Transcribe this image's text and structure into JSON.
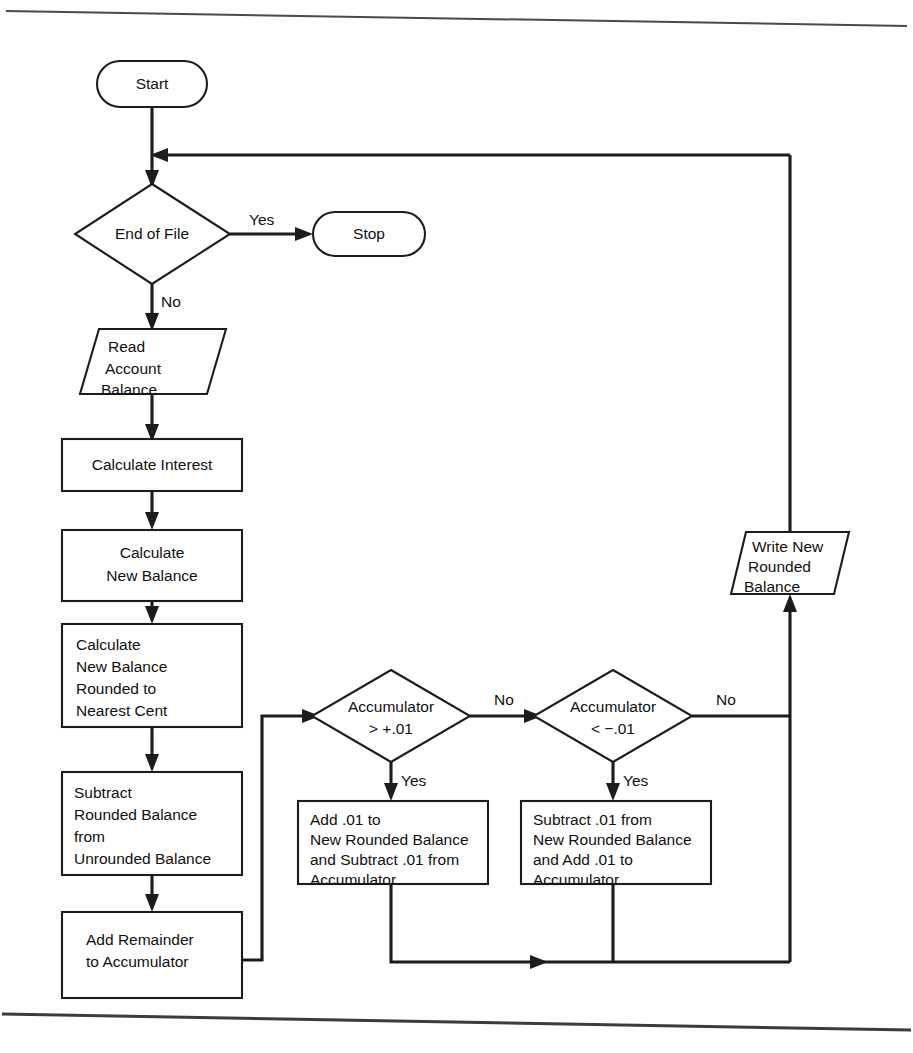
{
  "diagram": {
    "type": "flowchart",
    "nodes": {
      "start": {
        "label": "Start",
        "shape": "terminator"
      },
      "end_of_file": {
        "label": "End of File",
        "shape": "decision"
      },
      "stop": {
        "label": "Stop",
        "shape": "terminator"
      },
      "read_account_balance": {
        "shape": "io-parallelogram",
        "lines": [
          "Read",
          "Account",
          "Balance"
        ]
      },
      "calculate_interest": {
        "shape": "process",
        "lines": [
          "Calculate Interest"
        ]
      },
      "calculate_new_balance": {
        "shape": "process",
        "lines": [
          "Calculate",
          "New Balance"
        ]
      },
      "calculate_rounded": {
        "shape": "process",
        "lines": [
          "Calculate",
          "New Balance",
          "Rounded to",
          "Nearest Cent"
        ]
      },
      "subtract_rounded": {
        "shape": "process",
        "lines": [
          "Subtract",
          "Rounded Balance",
          "from",
          "Unrounded Balance"
        ]
      },
      "add_remainder": {
        "shape": "process",
        "lines": [
          "Add Remainder",
          "to Accumulator"
        ]
      },
      "accumulator_gt": {
        "shape": "decision",
        "lines": [
          "Accumulator",
          "> +.01"
        ]
      },
      "accumulator_lt": {
        "shape": "decision",
        "lines": [
          "Accumulator",
          "< −.01"
        ]
      },
      "add_point_01": {
        "shape": "process",
        "lines": [
          "Add .01 to",
          "New Rounded Balance",
          "and Subtract .01 from",
          "Accumulator"
        ]
      },
      "subtract_point_01": {
        "shape": "process",
        "lines": [
          "Subtract .01 from",
          "New Rounded Balance",
          "and Add .01 to",
          "Accumulator"
        ]
      },
      "write_new_rounded": {
        "shape": "io-parallelogram",
        "lines": [
          "Write New",
          "Rounded",
          "Balance"
        ]
      }
    },
    "edge_labels": {
      "eof_yes": "Yes",
      "eof_no": "No",
      "acc_gt_no": "No",
      "acc_gt_yes": "Yes",
      "acc_lt_no": "No",
      "acc_lt_yes": "Yes"
    },
    "colors": {
      "stroke": "#1c1c1c",
      "fill": "#ffffff",
      "text": "#101010",
      "rule": "#3c3c3c"
    }
  }
}
